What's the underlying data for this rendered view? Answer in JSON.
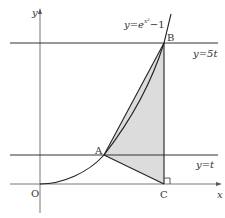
{
  "diagram": {
    "colors": {
      "line": "#333333",
      "axis": "#555555",
      "shade": "#dcdcdc",
      "background": "#ffffff"
    },
    "axes": {
      "x_label": "x",
      "y_label": "y",
      "origin_label": "O"
    },
    "curve": {
      "label_prefix": "y=e",
      "label_exponent": "x²",
      "label_suffix": "−1"
    },
    "lines": {
      "upper": {
        "label": "y=5t"
      },
      "lower": {
        "label": "y=t"
      }
    },
    "points": {
      "A": {
        "label": "A"
      },
      "B": {
        "label": "B"
      },
      "C": {
        "label": "C"
      }
    },
    "shaded_region": "triangle ABC",
    "right_angle_marker": "at C"
  }
}
